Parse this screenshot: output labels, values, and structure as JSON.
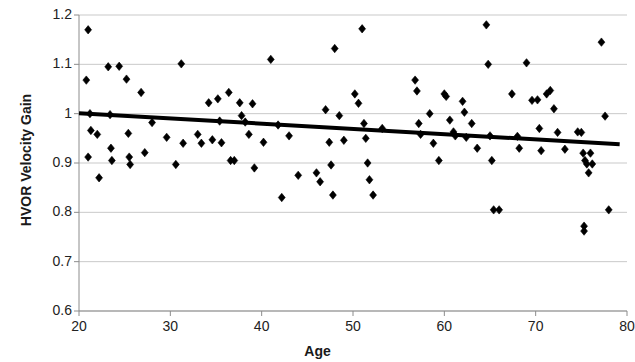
{
  "chart_data": {
    "type": "scatter",
    "title": "",
    "xlabel": "Age",
    "ylabel": "HVOR Velocity Gain",
    "xlim": [
      20,
      80
    ],
    "ylim": [
      0.6,
      1.2
    ],
    "xticks": [
      20,
      30,
      40,
      50,
      60,
      70,
      80
    ],
    "yticks": [
      "0.6",
      "0.7",
      "0.8",
      "0.9",
      "1",
      "1.1",
      "1.2"
    ],
    "grid": true,
    "legend": "none",
    "marker": "diamond",
    "marker_color": "#000000",
    "series": [
      {
        "name": "HVOR Velocity Gain vs Age",
        "points": [
          [
            21.0,
            1.17
          ],
          [
            20.8,
            1.068
          ],
          [
            21.2,
            1.0
          ],
          [
            21.3,
            0.966
          ],
          [
            21.0,
            0.912
          ],
          [
            22.0,
            0.958
          ],
          [
            22.2,
            0.87
          ],
          [
            23.2,
            1.095
          ],
          [
            23.4,
            0.998
          ],
          [
            23.5,
            0.93
          ],
          [
            23.6,
            0.905
          ],
          [
            24.4,
            1.096
          ],
          [
            25.2,
            1.07
          ],
          [
            25.4,
            0.96
          ],
          [
            25.5,
            0.912
          ],
          [
            25.6,
            0.897
          ],
          [
            26.8,
            1.043
          ],
          [
            27.2,
            0.921
          ],
          [
            28.0,
            0.982
          ],
          [
            29.6,
            0.952
          ],
          [
            30.6,
            0.897
          ],
          [
            31.2,
            1.101
          ],
          [
            31.4,
            0.94
          ],
          [
            33.0,
            0.958
          ],
          [
            33.4,
            0.94
          ],
          [
            34.2,
            1.022
          ],
          [
            34.6,
            0.947
          ],
          [
            35.2,
            1.03
          ],
          [
            35.4,
            0.985
          ],
          [
            35.6,
            0.941
          ],
          [
            36.4,
            1.043
          ],
          [
            36.6,
            0.905
          ],
          [
            37.0,
            0.905
          ],
          [
            37.6,
            1.022
          ],
          [
            37.8,
            0.996
          ],
          [
            38.2,
            0.983
          ],
          [
            38.6,
            0.958
          ],
          [
            39.0,
            1.02
          ],
          [
            39.2,
            0.89
          ],
          [
            40.2,
            0.942
          ],
          [
            41.0,
            1.11
          ],
          [
            41.8,
            0.977
          ],
          [
            42.2,
            0.83
          ],
          [
            43.0,
            0.955
          ],
          [
            44.0,
            0.875
          ],
          [
            46.0,
            0.88
          ],
          [
            46.4,
            0.862
          ],
          [
            47.0,
            1.008
          ],
          [
            47.4,
            0.942
          ],
          [
            47.6,
            0.896
          ],
          [
            47.8,
            0.835
          ],
          [
            48.0,
            1.132
          ],
          [
            48.5,
            0.996
          ],
          [
            49.0,
            0.946
          ],
          [
            50.2,
            1.04
          ],
          [
            50.6,
            1.021
          ],
          [
            51.0,
            1.172
          ],
          [
            51.2,
            0.98
          ],
          [
            51.4,
            0.95
          ],
          [
            51.6,
            0.9
          ],
          [
            51.8,
            0.866
          ],
          [
            52.2,
            0.835
          ],
          [
            53.2,
            0.97
          ],
          [
            56.8,
            1.068
          ],
          [
            57.0,
            1.046
          ],
          [
            57.2,
            0.98
          ],
          [
            57.4,
            0.958
          ],
          [
            58.4,
            1.0
          ],
          [
            58.8,
            0.94
          ],
          [
            59.4,
            0.905
          ],
          [
            60.0,
            1.04
          ],
          [
            60.2,
            1.035
          ],
          [
            60.6,
            0.987
          ],
          [
            61.0,
            0.963
          ],
          [
            61.2,
            0.955
          ],
          [
            62.0,
            1.025
          ],
          [
            62.2,
            1.003
          ],
          [
            62.4,
            0.952
          ],
          [
            63.0,
            0.98
          ],
          [
            63.6,
            0.93
          ],
          [
            64.6,
            1.18
          ],
          [
            64.8,
            1.1
          ],
          [
            65.0,
            0.955
          ],
          [
            65.2,
            0.905
          ],
          [
            65.4,
            0.805
          ],
          [
            66.0,
            0.805
          ],
          [
            67.4,
            1.04
          ],
          [
            68.0,
            0.954
          ],
          [
            68.2,
            0.93
          ],
          [
            69.0,
            1.103
          ],
          [
            69.6,
            1.027
          ],
          [
            70.2,
            1.028
          ],
          [
            70.4,
            0.97
          ],
          [
            70.6,
            0.925
          ],
          [
            71.2,
            1.04
          ],
          [
            71.6,
            1.047
          ],
          [
            72.0,
            1.01
          ],
          [
            72.4,
            0.962
          ],
          [
            73.2,
            0.928
          ],
          [
            74.6,
            0.963
          ],
          [
            75.0,
            0.962
          ],
          [
            75.2,
            0.92
          ],
          [
            75.4,
            0.905
          ],
          [
            75.6,
            0.898
          ],
          [
            75.8,
            0.88
          ],
          [
            76.0,
            0.92
          ],
          [
            76.2,
            0.898
          ],
          [
            75.3,
            0.772
          ],
          [
            75.3,
            0.762
          ],
          [
            77.2,
            1.145
          ],
          [
            77.6,
            0.995
          ],
          [
            78.0,
            0.805
          ]
        ]
      }
    ],
    "trendline": {
      "type": "linear",
      "x_start": 20,
      "y_start": 1.001,
      "x_end": 79.2,
      "y_end": 0.938,
      "color": "#000000",
      "width": 4
    }
  },
  "axes": {
    "y_title": "HVOR Velocity Gain",
    "x_title": "Age",
    "y_tick_labels": [
      "1.2",
      "1.1",
      "1",
      "0.9",
      "0.8",
      "0.7",
      "0.6"
    ],
    "x_tick_labels": [
      "20",
      "30",
      "40",
      "50",
      "60",
      "70",
      "80"
    ]
  },
  "style": {
    "grid_color": "#c9c9c9",
    "axis_color": "#8c8c8c",
    "background": "#ffffff",
    "text_color": "#1a1a1a"
  }
}
